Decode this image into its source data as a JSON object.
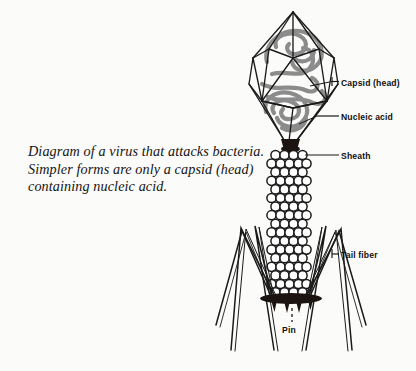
{
  "figure": {
    "title": "Diagram of a virus that attacks bacteria",
    "background_color": "#fbfbf9",
    "ink_color": "#1a1a1a",
    "nucleic_acid_color": "#8a8a8a"
  },
  "caption": {
    "line1": "Diagram of a virus that attacks bacteria.",
    "line2": "Simpler forms are only a capsid (head)",
    "line3": "containing nucleic acid."
  },
  "labels": {
    "capsid": "Capsid (head)",
    "nucleic_acid": "Nucleic acid",
    "sheath": "Sheath",
    "tail_fiber": "Tail fiber",
    "pin": "Pin"
  },
  "parts": [
    {
      "name": "capsid-head",
      "label": "Capsid (head)",
      "shape": "icosahedron-wireframe"
    },
    {
      "name": "nucleic-acid",
      "label": "Nucleic acid",
      "shape": "coiled-strand"
    },
    {
      "name": "collar",
      "label": "",
      "shape": "dark-band"
    },
    {
      "name": "sheath",
      "label": "Sheath",
      "shape": "stacked-circles"
    },
    {
      "name": "baseplate",
      "label": "",
      "shape": "dark-ellipse"
    },
    {
      "name": "pin",
      "label": "Pin",
      "shape": "spikes"
    },
    {
      "name": "tail-fiber",
      "label": "Tail fiber",
      "shape": "bent-fibers"
    }
  ]
}
